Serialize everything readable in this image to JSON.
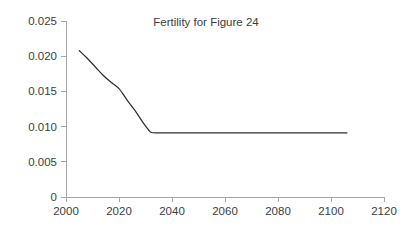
{
  "chart_data": {
    "type": "line",
    "title": "Fertility for Figure 24",
    "xlabel": "",
    "ylabel": "",
    "xlim": [
      2000,
      2120
    ],
    "ylim": [
      0,
      0.025
    ],
    "grid": false,
    "legend": "none",
    "x_ticks": [
      2000,
      2020,
      2040,
      2060,
      2080,
      2100,
      2120
    ],
    "x_tick_labels": [
      "2000",
      "2020",
      "2040",
      "2060",
      "2080",
      "2100",
      "2120"
    ],
    "y_ticks": [
      0,
      0.005,
      0.01,
      0.015,
      0.02,
      0.025
    ],
    "y_tick_labels": [
      "0",
      "0.005",
      "0.010",
      "0.015",
      "0.020",
      "0.025"
    ],
    "series": [
      {
        "name": "Fertility",
        "color": "#2e2e2e",
        "x": [
          2005,
          2008,
          2011,
          2014,
          2017,
          2020,
          2023,
          2026,
          2029,
          2031,
          2032,
          2034,
          2040,
          2050,
          2060,
          2070,
          2080,
          2090,
          2100,
          2106
        ],
        "y": [
          0.0208,
          0.0197,
          0.0185,
          0.0173,
          0.0163,
          0.0154,
          0.0138,
          0.0123,
          0.0106,
          0.0096,
          0.0092,
          0.0091,
          0.0091,
          0.0091,
          0.0091,
          0.0091,
          0.0091,
          0.0091,
          0.0091,
          0.0091
        ]
      }
    ],
    "annotations": []
  },
  "figure": {
    "title": "Fertility for Figure 24",
    "background_color": "#ffffff",
    "axis_color": "#a6a6a6",
    "line_color": "#2e2e2e",
    "text_color": "#3c3c3c"
  },
  "geometry": {
    "plot_left": 66,
    "plot_right": 384,
    "plot_top": 21,
    "plot_bottom": 197,
    "title_x": 206,
    "title_y": 26
  }
}
